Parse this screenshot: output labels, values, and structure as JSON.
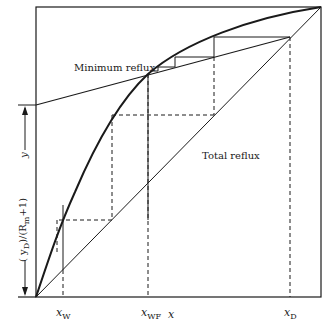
{
  "diagram": {
    "annotations": {
      "minimum_reflux": "Minimum reflux",
      "total_reflux": "Total reflux"
    },
    "axes": {
      "x_label": "x",
      "y_label": "y",
      "intercept_label": "(y_D)/(R_m+1)",
      "intercept_main": "( y",
      "intercept_sub_D": "D",
      "intercept_mid": ")/(R",
      "intercept_sub_m": "m",
      "intercept_end": "+1)"
    },
    "x_ticks": [
      {
        "main": "x",
        "sub": "W"
      },
      {
        "main": "x",
        "sub": "WF"
      },
      {
        "main": "x",
        "sub": "D"
      }
    ],
    "colors": {
      "line": "#1a1a1a",
      "background": "#ffffff"
    }
  }
}
